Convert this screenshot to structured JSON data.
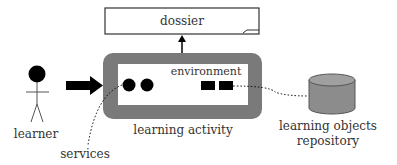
{
  "diagram": {
    "dossier": {
      "label": "dossier"
    },
    "learning_activity": {
      "label": "learning activity",
      "environment_label": "environment"
    },
    "learner": {
      "label": "learner"
    },
    "services": {
      "label": "services"
    },
    "repository": {
      "label_line1": "learning objects",
      "label_line2": "repository"
    },
    "colors": {
      "activity_frame": "#7a7a7a",
      "cylinder": "#8c8c8c",
      "cylinder_top": "#a0a0a0",
      "ink": "#000000",
      "text": "#333333"
    }
  }
}
